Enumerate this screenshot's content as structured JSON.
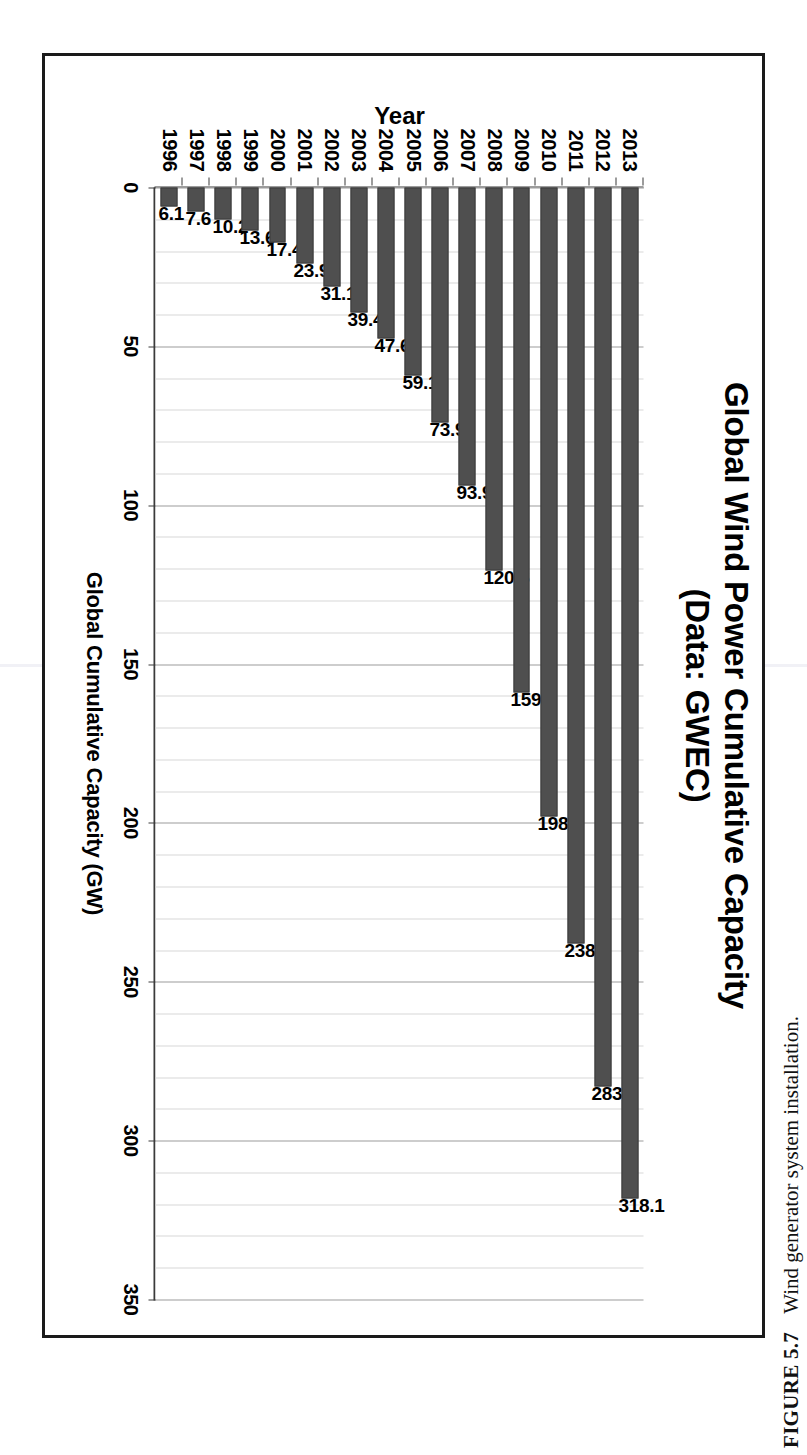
{
  "figure": {
    "caption_label": "FIGURE 5.7",
    "caption_text": "Wind generator system installation."
  },
  "chart_data": {
    "type": "bar",
    "title": "Global Wind Power Cumulative Capacity\n(Data: GWEC)",
    "title_line1": "Global Wind Power Cumulative Capacity",
    "title_line2": "(Data: GWEC)",
    "xlabel": "Year",
    "ylabel": "Global Cumulative Capacity (GW)",
    "ylim": [
      0,
      350
    ],
    "ytick_step": 50,
    "minor_gridline_step": 10,
    "grid": true,
    "legend": false,
    "bar_color": "#4f4f4f",
    "categories": [
      "1996",
      "1997",
      "1998",
      "1999",
      "2000",
      "2001",
      "2002",
      "2003",
      "2004",
      "2005",
      "2006",
      "2007",
      "2008",
      "2009",
      "2010",
      "2011",
      "2012",
      "2013"
    ],
    "values": [
      6.1,
      7.6,
      10.2,
      13.6,
      17.4,
      23.9,
      31.1,
      39.4,
      47.6,
      59.1,
      73.9,
      93.9,
      120.6,
      159.0,
      198.0,
      238.1,
      283.0,
      318.1
    ],
    "data_labels": [
      "6.1",
      "7.6",
      "10.2",
      "13.6",
      "17.4",
      "23.9",
      "31.1",
      "39.4",
      "47.6",
      "59.1",
      "73.9",
      "93.9",
      "120.6",
      "159.0",
      "198.0",
      "238.1",
      "283.0",
      "318.1"
    ],
    "ytick_labels": [
      "0",
      "50",
      "100",
      "150",
      "200",
      "250",
      "300",
      "350"
    ],
    "ytick_values": [
      0,
      50,
      100,
      150,
      200,
      250,
      300,
      350
    ]
  }
}
